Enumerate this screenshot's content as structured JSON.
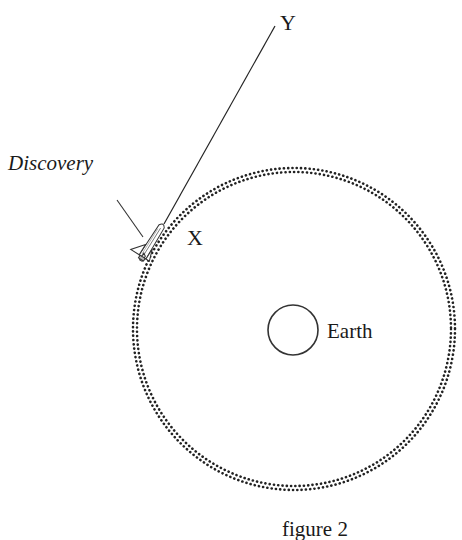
{
  "figure": {
    "caption": "figure 2",
    "labels": {
      "spacecraft": "Discovery",
      "point_x": "X",
      "point_y": "Y",
      "planet": "Earth"
    },
    "elements": {
      "orbit": {
        "style": "double dotted circle",
        "center": [
          294,
          329
        ],
        "radius": 159
      },
      "earth": {
        "center": [
          293,
          330
        ],
        "radius": 25
      },
      "shuttle": {
        "position": [
          150,
          243
        ],
        "orientation": "nose up-right, tangent to orbit"
      },
      "tangent_line": {
        "from": [
          165,
          222
        ],
        "to": [
          274,
          27
        ],
        "from_label": "X",
        "to_label": "Y"
      },
      "leader_line": {
        "from": [
          118,
          200
        ],
        "to": [
          143,
          236
        ],
        "label": "Discovery"
      }
    },
    "colors": {
      "ink": "#1a1a1a",
      "background": "#ffffff"
    }
  }
}
